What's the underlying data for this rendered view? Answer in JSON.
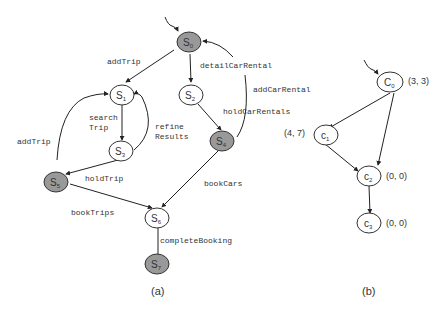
{
  "panel_a": {
    "caption": "(a)",
    "nodes": [
      {
        "id": "S0",
        "base": "S",
        "sub": "0",
        "shaded": true
      },
      {
        "id": "S1",
        "base": "S",
        "sub": "1",
        "shaded": false
      },
      {
        "id": "S2",
        "base": "S",
        "sub": "2",
        "shaded": false
      },
      {
        "id": "S3",
        "base": "S",
        "sub": "3",
        "shaded": false
      },
      {
        "id": "S4",
        "base": "S",
        "sub": "4",
        "shaded": true
      },
      {
        "id": "S5",
        "base": "S",
        "sub": "5",
        "shaded": true
      },
      {
        "id": "S6",
        "base": "S",
        "sub": "6",
        "shaded": false
      },
      {
        "id": "S7",
        "base": "S",
        "sub": "7",
        "shaded": true
      }
    ],
    "edge_labels": {
      "addTrip_top": "addTrip",
      "detailCarRental": "detailCarRental",
      "addCarRental": "addCarRental",
      "holdCarRentals": "holdCarRentals",
      "searchTrip_1": "search",
      "searchTrip_2": "Trip",
      "refineResults_1": "refine",
      "refineResults_2": "Results",
      "addTrip_left": "addTrip",
      "holdTrip": "holdTrip",
      "bookCars": "bookCars",
      "bookTrips": "bookTrips",
      "completeBooking": "completeBooking"
    }
  },
  "panel_b": {
    "caption": "(b)",
    "nodes": [
      {
        "id": "C0",
        "base": "C",
        "sub": "0",
        "value": "(3, 3)"
      },
      {
        "id": "c1",
        "base": "c",
        "sub": "1",
        "value": "(4, 7)"
      },
      {
        "id": "c2",
        "base": "c",
        "sub": "2",
        "value": "(0, 0)"
      },
      {
        "id": "c3",
        "base": "c",
        "sub": "3",
        "value": "(0, 0)"
      }
    ]
  },
  "colors": {
    "shaded": "#999999",
    "stroke": "#333333",
    "line": "#222222"
  }
}
